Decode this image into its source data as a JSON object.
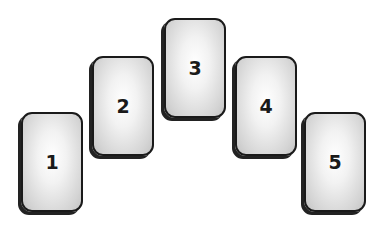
{
  "diagram": {
    "type": "card-spread",
    "cards": [
      {
        "label": "1",
        "x": 21,
        "y": 112
      },
      {
        "label": "2",
        "x": 92,
        "y": 56
      },
      {
        "label": "3",
        "x": 164,
        "y": 18
      },
      {
        "label": "4",
        "x": 235,
        "y": 56
      },
      {
        "label": "5",
        "x": 304,
        "y": 112
      }
    ]
  }
}
